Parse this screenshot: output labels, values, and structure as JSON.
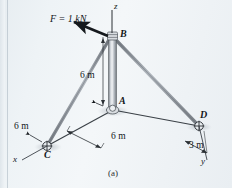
{
  "figure": {
    "caption": "(a)",
    "force": {
      "label": "F = 1 kN",
      "magnitude": 1,
      "unit": "kN",
      "applied_at": "B"
    },
    "axes": [
      {
        "name": "x-axis",
        "label": "x"
      },
      {
        "name": "y-axis",
        "label": "y"
      },
      {
        "name": "z-axis",
        "label": "z"
      }
    ],
    "nodes": [
      {
        "id": "A",
        "label": "A",
        "type": "ball-and-socket-base"
      },
      {
        "id": "B",
        "label": "B",
        "type": "pole-top-collar"
      },
      {
        "id": "C",
        "label": "C",
        "type": "ball-and-socket-support"
      },
      {
        "id": "D",
        "label": "D",
        "type": "ball-and-socket-support"
      }
    ],
    "dimensions": [
      {
        "name": "pole-height-AB",
        "label": "6 m",
        "value": 6,
        "unit": "m"
      },
      {
        "name": "x-offset-AC",
        "label": "6 m",
        "value": 6,
        "unit": "m"
      },
      {
        "name": "y-offset-A-to-D-base",
        "label": "6 m",
        "value": 6,
        "unit": "m"
      },
      {
        "name": "x-offset-D",
        "label": "3 m",
        "value": 3,
        "unit": "m"
      }
    ],
    "members": [
      {
        "name": "pole-AB",
        "from": "A",
        "to": "B",
        "kind": "pole"
      },
      {
        "name": "cable-BC",
        "from": "B",
        "to": "C",
        "kind": "cable"
      },
      {
        "name": "cable-BD",
        "from": "B",
        "to": "D",
        "kind": "cable"
      },
      {
        "name": "ground-line-AC",
        "from": "A",
        "to": "C",
        "kind": "ground"
      },
      {
        "name": "ground-line-AD",
        "from": "A",
        "to": "D",
        "kind": "ground"
      }
    ],
    "colors": {
      "background": "#eef2f5",
      "member": "#8a8f96",
      "line": "#2a2f34",
      "text": "#13171b"
    }
  }
}
